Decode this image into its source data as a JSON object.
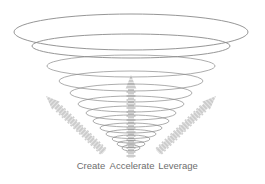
{
  "diagram": {
    "type": "funnel-vortex",
    "center_x": 131,
    "ellipse_stroke": "#8a8a8a",
    "arrow_fill": "#c4c4c4",
    "arrow_stripe": "#e8e8e8",
    "ellipses": [
      {
        "cy": 32,
        "rx": 117,
        "ry": 18
      },
      {
        "cy": 46,
        "rx": 99,
        "ry": 12
      },
      {
        "cy": 66,
        "rx": 84,
        "ry": 11
      },
      {
        "cy": 81,
        "rx": 72,
        "ry": 10
      },
      {
        "cy": 93,
        "rx": 61,
        "ry": 9
      },
      {
        "cy": 104,
        "rx": 53,
        "ry": 8
      },
      {
        "cy": 113,
        "rx": 45,
        "ry": 7
      },
      {
        "cy": 121,
        "rx": 38,
        "ry": 6
      },
      {
        "cy": 128,
        "rx": 31,
        "ry": 5
      },
      {
        "cy": 134,
        "rx": 25,
        "ry": 4.5
      },
      {
        "cy": 139,
        "rx": 19,
        "ry": 4
      },
      {
        "cy": 144,
        "rx": 14,
        "ry": 3.5
      },
      {
        "cy": 148,
        "rx": 9,
        "ry": 3
      }
    ],
    "arrows": [
      {
        "name": "create",
        "x1": 104,
        "y1": 152,
        "x2": 46,
        "y2": 96
      },
      {
        "name": "accelerate",
        "x1": 131,
        "y1": 158,
        "x2": 131,
        "y2": 75
      },
      {
        "name": "leverage",
        "x1": 158,
        "y1": 152,
        "x2": 216,
        "y2": 96
      }
    ]
  },
  "labels": {
    "create": "Create",
    "accelerate": "Accelerate",
    "leverage": "Leverage"
  }
}
